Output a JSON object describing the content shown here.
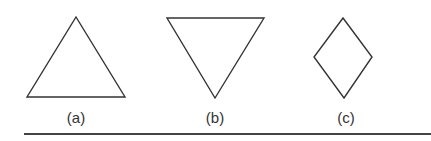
{
  "figure": {
    "shapes": [
      {
        "id": "a",
        "kind": "triangle-up",
        "label": "(a)",
        "points": "76,17 125,97 27,97"
      },
      {
        "id": "b",
        "kind": "triangle-down",
        "label": "(b)",
        "points": "167,18 264,18 215,98"
      },
      {
        "id": "c",
        "kind": "diamond",
        "label": "(c)",
        "points": "343,18 372,57 344,98 314,57"
      }
    ],
    "stroke_color": "#333333"
  }
}
